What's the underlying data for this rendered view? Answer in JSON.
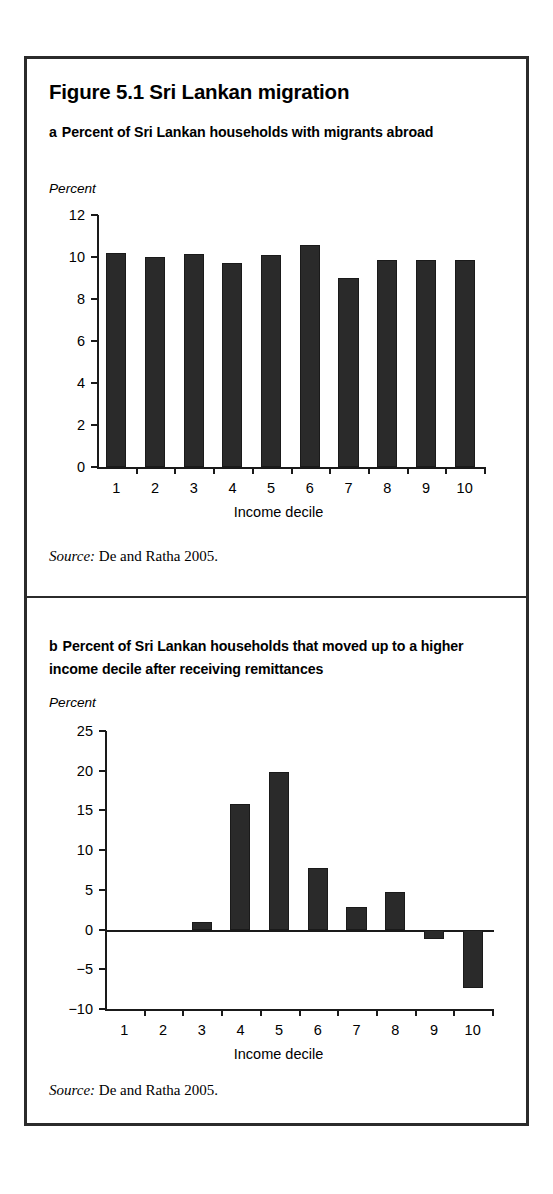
{
  "figure": {
    "title": "Figure 5.1  Sri Lankan migration",
    "frame_color": "#2b2b2b",
    "bar_color": "#2a2a2a"
  },
  "panel_a": {
    "label": "a",
    "heading": "Percent of Sri Lankan households with migrants abroad",
    "unit_label": "Percent",
    "source_word": "Source:",
    "source_text": " De and Ratha 2005."
  },
  "panel_b": {
    "label": "b",
    "heading": "Percent of Sri Lankan households that moved up to a higher income decile after receiving remittances",
    "unit_label": "Percent",
    "source_word": "Source:",
    "source_text": " De and Ratha 2005."
  },
  "chart_data": [
    {
      "id": "panel-a",
      "type": "bar",
      "title": "a  Percent of Sri Lankan households with migrants abroad",
      "xlabel": "Income decile",
      "ylabel": "Percent",
      "categories": [
        "1",
        "2",
        "3",
        "4",
        "5",
        "6",
        "7",
        "8",
        "9",
        "10"
      ],
      "values": [
        10.2,
        10.0,
        10.15,
        9.7,
        10.1,
        10.55,
        9.0,
        9.85,
        9.85,
        9.85
      ],
      "ylim": [
        0,
        12
      ],
      "yticks": [
        0,
        2,
        4,
        6,
        8,
        10,
        12
      ],
      "ytick_labels": [
        "0",
        "2",
        "4",
        "6",
        "8",
        "10",
        "12"
      ],
      "grid": false,
      "legend": "none"
    },
    {
      "id": "panel-b",
      "type": "bar",
      "title": "b  Percent of Sri Lankan households that moved up to a higher income decile after receiving remittances",
      "xlabel": "Income decile",
      "ylabel": "Percent",
      "categories": [
        "1",
        "2",
        "3",
        "4",
        "5",
        "6",
        "7",
        "8",
        "9",
        "10"
      ],
      "values": [
        0,
        0,
        0.9,
        15.8,
        19.9,
        7.8,
        2.8,
        4.7,
        -1.2,
        -7.3
      ],
      "ylim": [
        -10,
        25
      ],
      "yticks": [
        -10,
        -5,
        0,
        5,
        10,
        15,
        20,
        25
      ],
      "ytick_labels": [
        "−10",
        "−5",
        "0",
        "5",
        "10",
        "15",
        "20",
        "25"
      ],
      "grid": false,
      "legend": "none"
    }
  ]
}
